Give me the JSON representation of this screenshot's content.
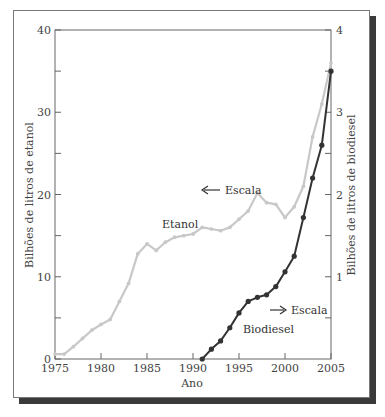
{
  "chart_data": {
    "type": "line",
    "title": "",
    "xlabel": "Ano",
    "ylabel_left": "Bilhões de litros de etanol",
    "ylabel_right": "Bilhões de litros de biodiesel",
    "xlim": [
      1975,
      2005
    ],
    "ylim_left": [
      0,
      40
    ],
    "ylim_right": [
      0,
      4
    ],
    "x_ticks": [
      1975,
      1980,
      1985,
      1990,
      1995,
      2000,
      2005
    ],
    "y_ticks_left": [
      0,
      10,
      20,
      30,
      40
    ],
    "y_ticks_right": [
      1,
      2,
      3,
      4
    ],
    "grid": false,
    "series": [
      {
        "name": "Etanol",
        "axis": "left",
        "color": "#c8c8c8",
        "x": [
          1975,
          1976,
          1977,
          1978,
          1979,
          1980,
          1981,
          1982,
          1983,
          1984,
          1985,
          1986,
          1987,
          1988,
          1989,
          1990,
          1991,
          1992,
          1993,
          1994,
          1995,
          1996,
          1997,
          1998,
          1999,
          2000,
          2001,
          2002,
          2003,
          2004,
          2005
        ],
        "values": [
          0.6,
          0.6,
          1.5,
          2.5,
          3.5,
          4.2,
          4.8,
          7.0,
          9.2,
          12.8,
          14.0,
          13.2,
          14.2,
          14.8,
          15.0,
          15.2,
          16.0,
          15.8,
          15.6,
          16.0,
          17.0,
          18.0,
          20.2,
          19.0,
          18.8,
          17.2,
          18.5,
          21.0,
          27.0,
          31.0,
          36.0
        ]
      },
      {
        "name": "Biodiesel",
        "axis": "right",
        "color": "#333333",
        "x": [
          1991,
          1992,
          1993,
          1994,
          1995,
          1996,
          1997,
          1998,
          1999,
          2000,
          2001,
          2002,
          2003,
          2004,
          2005
        ],
        "values": [
          0.0,
          0.12,
          0.22,
          0.38,
          0.56,
          0.7,
          0.75,
          0.78,
          0.88,
          1.06,
          1.25,
          1.72,
          2.2,
          2.6,
          3.5
        ]
      }
    ],
    "annotations": [
      {
        "text": "Etanol",
        "near": [
          1987.5,
          17.5
        ]
      },
      {
        "text": "Escala",
        "arrow": "left",
        "near": [
          1990,
          22
        ]
      },
      {
        "text": "Biodiesel",
        "near": [
          1995.5,
          0.35
        ]
      },
      {
        "text": "Escala",
        "arrow": "right",
        "near": [
          1998,
          0.62
        ]
      }
    ]
  },
  "labels": {
    "xlabel": "Ano",
    "ylabel_left": "Bilhões de litros de etanol",
    "ylabel_right": "Bilhões de litros de biodiesel",
    "etanol": "Etanol",
    "biodiesel": "Biodiesel",
    "escala": "Escala"
  }
}
